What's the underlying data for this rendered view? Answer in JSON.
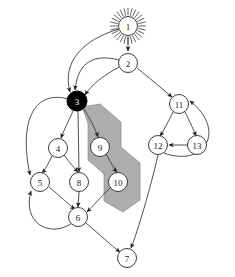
{
  "figure": {
    "width": 235,
    "height": 277,
    "background_color": "#ffffff"
  },
  "style": {
    "node_fill": "#ffffff",
    "node_stroke": "#3b3b3b",
    "node_filled_fill": "#000000",
    "node_label_color": "#1a1a1a",
    "node_label_inverted_color": "#ffffff",
    "edge_color": "#3b3b3b",
    "region_fill": "#a9a9a9",
    "region_stroke": "#8a8a8a"
  },
  "graph": {
    "node_radius": 9.5,
    "nodes": [
      {
        "id": "1",
        "label": "1",
        "cx": 128,
        "cy": 26,
        "r": 9.5,
        "filled": false,
        "decoration": "sunburst",
        "rays": 28,
        "ray_inner": 10.5,
        "ray_outer": 18
      },
      {
        "id": "2",
        "label": "2",
        "cx": 128,
        "cy": 63,
        "r": 9.5,
        "filled": false,
        "decoration": "none"
      },
      {
        "id": "3",
        "label": "3",
        "cx": 77,
        "cy": 101,
        "r": 10,
        "filled": true,
        "decoration": "none"
      },
      {
        "id": "4",
        "label": "4",
        "cx": 58,
        "cy": 148,
        "r": 9.5,
        "filled": false,
        "decoration": "none"
      },
      {
        "id": "5",
        "label": "5",
        "cx": 40,
        "cy": 182,
        "r": 9.5,
        "filled": false,
        "decoration": "none"
      },
      {
        "id": "6",
        "label": "6",
        "cx": 78,
        "cy": 217,
        "r": 9.5,
        "filled": false,
        "decoration": "none"
      },
      {
        "id": "7",
        "label": "7",
        "cx": 127,
        "cy": 258,
        "r": 9.5,
        "filled": false,
        "decoration": "none"
      },
      {
        "id": "8",
        "label": "8",
        "cx": 79,
        "cy": 182,
        "r": 9.5,
        "filled": false,
        "decoration": "none"
      },
      {
        "id": "9",
        "label": "9",
        "cx": 100,
        "cy": 147,
        "r": 9.5,
        "filled": false,
        "decoration": "none"
      },
      {
        "id": "10",
        "label": "10",
        "cx": 118,
        "cy": 182,
        "r": 9.5,
        "filled": false,
        "decoration": "none"
      },
      {
        "id": "11",
        "label": "11",
        "cx": 179,
        "cy": 104,
        "r": 9.5,
        "filled": false,
        "decoration": "none"
      },
      {
        "id": "12",
        "label": "12",
        "cx": 158,
        "cy": 145,
        "r": 9.5,
        "filled": false,
        "decoration": "none"
      },
      {
        "id": "13",
        "label": "13",
        "cx": 197,
        "cy": 145,
        "r": 9.5,
        "filled": false,
        "decoration": "none"
      }
    ],
    "edges": [
      {
        "from": "1",
        "to": "2",
        "path": "M 128 36.5 L 128 51",
        "arrow": true
      },
      {
        "from": "1",
        "to": "3",
        "path": "M 119 29 C 82 40 62 62 70 92",
        "arrow": true
      },
      {
        "from": "2",
        "to": "3",
        "path": "M 119 60 C 96 54 78 60 75 90",
        "arrow": true
      },
      {
        "from": "2",
        "to": "3",
        "path": "M 119 67 C 103 76 92 84 85 95",
        "arrow": true
      },
      {
        "from": "2",
        "to": "11",
        "path": "M 137 68 C 152 80 166 92 172 97",
        "arrow": true
      },
      {
        "from": "3",
        "to": "4",
        "path": "M 73 111 C 68 122 64 130 61 138",
        "arrow": true
      },
      {
        "from": "3",
        "to": "9",
        "path": "M 84 109 C 90 119 95 128 98 137",
        "arrow": true
      },
      {
        "from": "3",
        "to": "8",
        "path": "M 78 111 L 79 172",
        "arrow": true
      },
      {
        "from": "3",
        "to": "5",
        "path": "M 68 99 C 36 90 18 118 30 175",
        "arrow": true
      },
      {
        "from": "4",
        "to": "5",
        "path": "M 52 156 C 48 164 45 170 42 173",
        "arrow": true
      },
      {
        "from": "4",
        "to": "8",
        "path": "M 64 155 C 70 163 75 169 78 172",
        "arrow": true
      },
      {
        "from": "5",
        "to": "6",
        "path": "M 49 187 C 59 195 69 205 75 209",
        "arrow": true
      },
      {
        "from": "8",
        "to": "6",
        "path": "M 79 192 L 78 207",
        "arrow": true
      },
      {
        "from": "9",
        "to": "10",
        "path": "M 106 154 C 111 163 115 170 117 172",
        "arrow": true
      },
      {
        "from": "10",
        "to": "6",
        "path": "M 110 188 C 100 198 92 207 87 212",
        "arrow": true
      },
      {
        "from": "6",
        "to": "5",
        "path": "M 71 224 C 48 238 22 222 31 191",
        "arrow": true
      },
      {
        "from": "6",
        "to": "7",
        "path": "M 86 223 C 100 235 112 246 120 252",
        "arrow": true
      },
      {
        "from": "11",
        "to": "12",
        "path": "M 173 112 C 168 122 163 132 160 136",
        "arrow": true
      },
      {
        "from": "11",
        "to": "13",
        "path": "M 185 112 C 190 122 194 131 196 136",
        "arrow": true
      },
      {
        "from": "13",
        "to": "12",
        "path": "M 187 145 L 169 145",
        "arrow": true
      },
      {
        "from": "12",
        "to": "11",
        "path": "M 164 153 C 205 168 227 130 190 101",
        "arrow": true
      },
      {
        "from": "12",
        "to": "7",
        "path": "M 158 155 C 150 190 138 230 131 248",
        "arrow": true
      }
    ],
    "regions": [
      {
        "name": "highlighted-subgraph",
        "contains": [
          "3",
          "9",
          "10"
        ],
        "points": "82 107 100 104 121 122 121 147 140 163 140 200 123 212 104 201 104 174 88 160 88 123"
      }
    ]
  }
}
